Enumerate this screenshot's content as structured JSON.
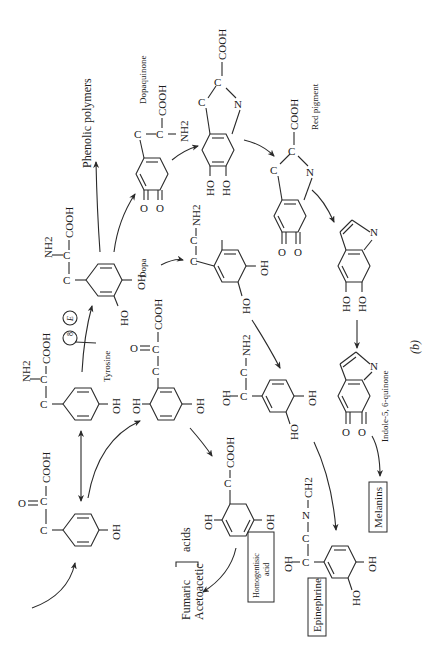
{
  "figure": {
    "panel_label": "(b)",
    "orientation": "rotated 90 degrees clockwise",
    "ink_color": "#1c1c1c",
    "background_color": "#ffffff"
  },
  "compounds": {
    "hppa": {
      "groups": [
        "O",
        "C",
        "C",
        "COOH",
        "OH"
      ]
    },
    "tyrosine": {
      "name": "Tyrosine",
      "groups": [
        "NH2",
        "C",
        "C",
        "COOH",
        "OH"
      ]
    },
    "dopa": {
      "name": "Dopa",
      "groups": [
        "NH2",
        "C",
        "C",
        "COOH",
        "OH",
        "HO"
      ]
    },
    "dopaquinone": {
      "name": "Dopaquinone",
      "groups": [
        "C",
        "C",
        "COOH",
        "NH2",
        "O",
        "O"
      ]
    },
    "leucodopachrome": {
      "groups": [
        "C",
        "C",
        "COOH",
        "N",
        "HO",
        "HO"
      ]
    },
    "red_pigment": {
      "name": "Red pigment",
      "groups": [
        "C",
        "C",
        "COOH",
        "N",
        "O",
        "O"
      ]
    },
    "dihydroxyindole": {
      "groups": [
        "N",
        "HO",
        "HO"
      ]
    },
    "indolequinone": {
      "name": "Indole-5, 6-quinone",
      "groups": [
        "N",
        "O",
        "O"
      ]
    },
    "melanins": {
      "name": "Melanins"
    },
    "dopamine": {
      "groups": [
        "C",
        "C",
        "NH2",
        "OH",
        "HO"
      ]
    },
    "norepinephrine": {
      "groups": [
        "OH",
        "C",
        "C",
        "NH2",
        "OH",
        "HO"
      ]
    },
    "epinephrine": {
      "name": "Epinephrine",
      "groups": [
        "OH",
        "C",
        "C",
        "N",
        "CH2",
        "OH",
        "HO"
      ]
    },
    "hppa_oxidized": {
      "groups": [
        "OH",
        "C",
        "C",
        "O",
        "COOH",
        "OH"
      ]
    },
    "homogentisic": {
      "name": "Homogentisic acid",
      "name_line1": "Homogentisic",
      "name_line2": "acid",
      "groups": [
        "OH",
        "C",
        "COOH",
        "OH"
      ]
    },
    "end_products": {
      "line1": "Fumaric",
      "line2": "Acetoacetic",
      "suffix": "acids"
    }
  },
  "other_labels": {
    "phenolic_polymers": "Phenolic polymers",
    "enzyme_block": "8",
    "enzyme_letter": "E"
  }
}
